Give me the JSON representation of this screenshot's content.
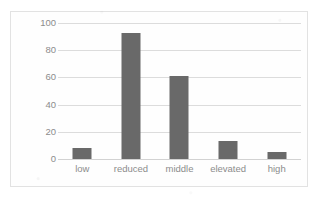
{
  "chart_data": {
    "type": "bar",
    "title": "",
    "subtitle": "",
    "xlabel": "",
    "ylabel": "",
    "categories": [
      "low",
      "reduced",
      "middle",
      "elevated",
      "high"
    ],
    "values": [
      8,
      93,
      61,
      13,
      5
    ],
    "series": [
      {
        "name": "",
        "values": [
          8,
          93,
          61,
          13,
          5
        ]
      }
    ],
    "ylim": [
      0,
      100
    ],
    "yticks": [
      0,
      20,
      40,
      60,
      80,
      100
    ],
    "ytick_labels": [
      "0",
      "20",
      "40",
      "60",
      "80",
      "100"
    ],
    "grid": "horizontal",
    "legend": "none",
    "annotations": [],
    "colors": {
      "bar": "#696969",
      "gridline": "#dcdcdc",
      "baseline": "#d2d2d2",
      "tick_label": "#8c8c8c",
      "frame_border": "#e2e2e2",
      "plot_background": "#fefefe"
    }
  }
}
